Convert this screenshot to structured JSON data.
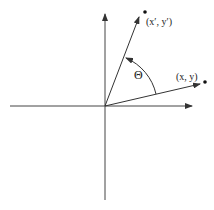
{
  "diagram": {
    "title": "",
    "labels": {
      "rotated_point": "(x′, y′)",
      "original_point": "(x, y)",
      "angle": "Θ"
    },
    "colors": {
      "stroke": "#333333",
      "background": "#ffffff"
    }
  }
}
